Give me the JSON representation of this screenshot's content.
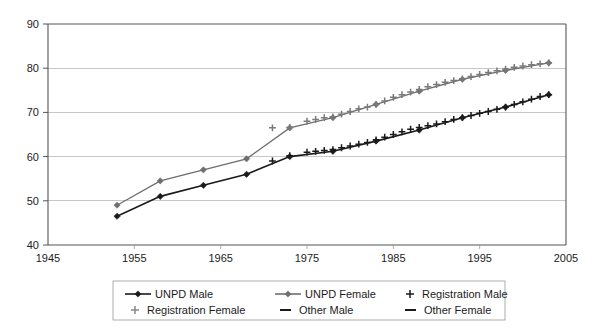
{
  "chart_data": {
    "type": "line",
    "title": "",
    "xlabel": "",
    "ylabel": "",
    "xlim": [
      1945,
      2005
    ],
    "ylim": [
      40,
      90
    ],
    "xticks": [
      1945,
      1955,
      1965,
      1975,
      1985,
      1995,
      2005
    ],
    "yticks": [
      40,
      50,
      60,
      70,
      80,
      90
    ],
    "grid": "horizontal",
    "legend_position": "bottom",
    "series": [
      {
        "name": "UNPD Male",
        "marker": "diamond",
        "color": "#1a1a1a",
        "x": [
          1953,
          1958,
          1963,
          1968,
          1973,
          1978,
          1983,
          1988,
          1993,
          1998,
          2003
        ],
        "values": [
          46.5,
          51.0,
          53.5,
          56.0,
          60.0,
          61.2,
          63.5,
          66.0,
          68.8,
          71.2,
          74.0
        ]
      },
      {
        "name": "UNPD Female",
        "marker": "diamond",
        "color": "#6e6e6e",
        "x": [
          1953,
          1958,
          1963,
          1968,
          1973,
          1978,
          1983,
          1988,
          1993,
          1998,
          2003
        ],
        "values": [
          49.0,
          54.5,
          57.0,
          59.5,
          66.5,
          68.8,
          71.8,
          74.8,
          77.5,
          79.5,
          81.2
        ]
      },
      {
        "name": "Registration Male",
        "marker": "plus",
        "color": "#1a1a1a",
        "x": [
          1971,
          1973,
          1975,
          1976,
          1977,
          1978,
          1979,
          1980,
          1981,
          1982,
          1983,
          1984,
          1985,
          1986,
          1987,
          1988,
          1989,
          1990,
          1991,
          1992,
          1993,
          1994,
          1995,
          1996,
          1997,
          1998,
          1999,
          2000,
          2001,
          2002,
          2003
        ],
        "values": [
          59.0,
          60.2,
          61.0,
          61.2,
          61.4,
          61.6,
          62.0,
          62.4,
          62.8,
          63.2,
          63.8,
          64.4,
          65.0,
          65.6,
          66.2,
          66.6,
          67.0,
          67.4,
          67.9,
          68.4,
          68.8,
          69.3,
          69.8,
          70.2,
          70.7,
          71.2,
          71.8,
          72.4,
          73.0,
          73.6,
          74.0
        ]
      },
      {
        "name": "Registration Female",
        "marker": "plus",
        "color": "#7a7a7a",
        "x": [
          1971,
          1973,
          1975,
          1976,
          1977,
          1978,
          1979,
          1980,
          1981,
          1982,
          1983,
          1984,
          1985,
          1986,
          1987,
          1988,
          1989,
          1990,
          1991,
          1992,
          1993,
          1994,
          1995,
          1996,
          1997,
          1998,
          1999,
          2000,
          2001,
          2002,
          2003
        ],
        "values": [
          66.5,
          66.6,
          68.0,
          68.4,
          68.8,
          69.0,
          69.6,
          70.2,
          70.8,
          71.2,
          71.8,
          72.6,
          73.4,
          74.0,
          74.6,
          75.2,
          75.8,
          76.3,
          76.8,
          77.2,
          77.6,
          78.1,
          78.6,
          79.0,
          79.4,
          79.8,
          80.2,
          80.5,
          80.8,
          81.0,
          81.2
        ]
      },
      {
        "name": "Other Male",
        "marker": "dash",
        "color": "#1a1a1a",
        "x": [],
        "values": []
      },
      {
        "name": "Other Female",
        "marker": "dash",
        "color": "#1a1a1a",
        "x": [],
        "values": []
      }
    ]
  },
  "axes": {
    "y_labels": [
      "90",
      "80",
      "70",
      "60",
      "50",
      "40"
    ],
    "x_labels": [
      "1945",
      "1955",
      "1965",
      "1975",
      "1985",
      "1995",
      "2005"
    ]
  },
  "legend": {
    "items": [
      {
        "label": "UNPD Male",
        "marker": "line-diamond",
        "color": "#1a1a1a"
      },
      {
        "label": "UNPD Female",
        "marker": "line-diamond",
        "color": "#6e6e6e"
      },
      {
        "label": "Registration Male",
        "marker": "plus",
        "color": "#1a1a1a"
      },
      {
        "label": "Registration Female",
        "marker": "plus",
        "color": "#8a8a8a"
      },
      {
        "label": "Other Male",
        "marker": "dash",
        "color": "#1a1a1a"
      },
      {
        "label": "Other Female",
        "marker": "dash",
        "color": "#1a1a1a"
      }
    ]
  }
}
